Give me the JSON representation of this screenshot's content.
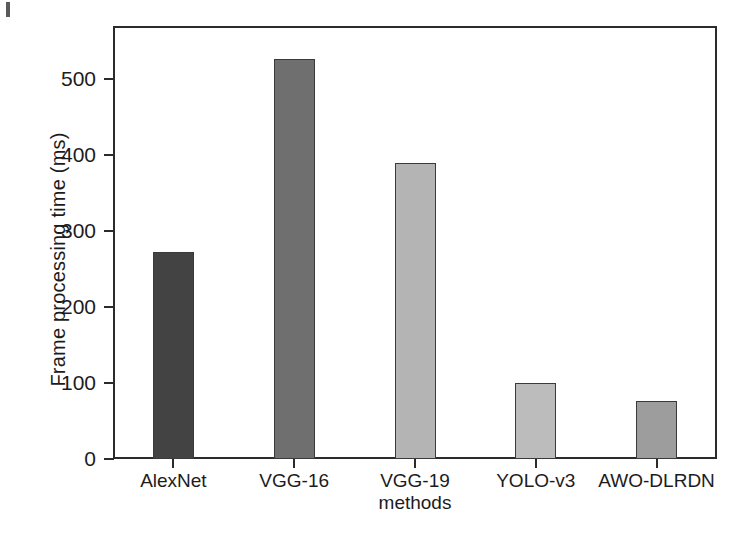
{
  "chart_data": {
    "type": "bar",
    "title": "",
    "categories": [
      "AlexNet",
      "VGG-16",
      "VGG-19",
      "YOLO-v3",
      "AWO-DLRDN"
    ],
    "values": [
      273,
      527,
      390,
      100,
      76
    ],
    "xlabel": "methods",
    "ylabel": "Frame processing time  (ms)",
    "ylim": [
      0,
      570
    ],
    "yticks": [
      0,
      100,
      200,
      300,
      400,
      500
    ],
    "ytick_labels": [
      "0",
      "100",
      "200",
      "300",
      "400",
      "500"
    ],
    "grid": false,
    "legend": "none",
    "bar_colors": [
      "#434343",
      "#6f6f6f",
      "#b4b4b4",
      "#bcbcbc",
      "#9d9d9d"
    ],
    "bar_edge_color": "#3a3a3a",
    "axis_color": "#2b2b2b",
    "background": "#ffffff"
  }
}
